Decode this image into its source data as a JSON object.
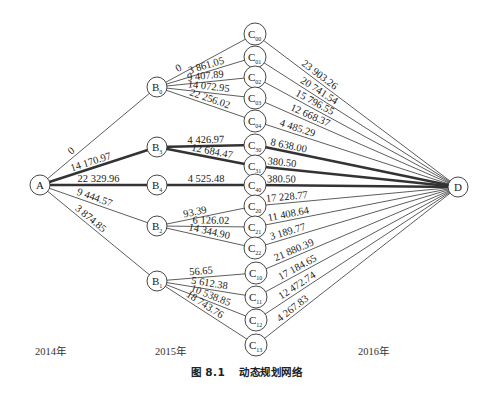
{
  "diagram": {
    "title": "动态规划网络",
    "figure_number": "图 8.1",
    "stage_labels": [
      {
        "text": "2014年",
        "x": 35
      },
      {
        "text": "2015年",
        "x": 155
      },
      {
        "text": "2016年",
        "x": 358
      }
    ],
    "nodes": [
      {
        "id": "A",
        "base": "A",
        "sub": "",
        "x": 40,
        "y": 185
      },
      {
        "id": "B0",
        "base": "B",
        "sub": "0",
        "x": 157,
        "y": 87
      },
      {
        "id": "B3",
        "base": "B",
        "sub": "3",
        "x": 157,
        "y": 147
      },
      {
        "id": "B4",
        "base": "B",
        "sub": "4",
        "x": 157,
        "y": 185
      },
      {
        "id": "B2",
        "base": "B",
        "sub": "2",
        "x": 157,
        "y": 226
      },
      {
        "id": "B1",
        "base": "B",
        "sub": "1",
        "x": 157,
        "y": 281
      },
      {
        "id": "C00",
        "base": "C",
        "sub": "00",
        "x": 255,
        "y": 34
      },
      {
        "id": "C01",
        "base": "C",
        "sub": "01",
        "x": 255,
        "y": 57
      },
      {
        "id": "C02",
        "base": "C",
        "sub": "02",
        "x": 255,
        "y": 77
      },
      {
        "id": "C03",
        "base": "C",
        "sub": "03",
        "x": 255,
        "y": 98
      },
      {
        "id": "C04",
        "base": "C",
        "sub": "04",
        "x": 255,
        "y": 121
      },
      {
        "id": "C30",
        "base": "C",
        "sub": "30",
        "x": 255,
        "y": 145
      },
      {
        "id": "C31",
        "base": "C",
        "sub": "31",
        "x": 255,
        "y": 166
      },
      {
        "id": "C40",
        "base": "C",
        "sub": "40",
        "x": 255,
        "y": 185
      },
      {
        "id": "C20",
        "base": "C",
        "sub": "20",
        "x": 255,
        "y": 206
      },
      {
        "id": "C21",
        "base": "C",
        "sub": "21",
        "x": 255,
        "y": 227
      },
      {
        "id": "C22",
        "base": "C",
        "sub": "22",
        "x": 255,
        "y": 248
      },
      {
        "id": "C10",
        "base": "C",
        "sub": "10",
        "x": 256,
        "y": 273
      },
      {
        "id": "C11",
        "base": "C",
        "sub": "11",
        "x": 256,
        "y": 297
      },
      {
        "id": "C12",
        "base": "C",
        "sub": "12",
        "x": 256,
        "y": 320
      },
      {
        "id": "C13",
        "base": "C",
        "sub": "13",
        "x": 256,
        "y": 345
      },
      {
        "id": "D",
        "base": "D",
        "sub": "",
        "x": 458,
        "y": 187
      }
    ],
    "edges": [
      {
        "from": "A",
        "to": "B0",
        "label": "0",
        "bold": false,
        "t": 0.3,
        "off": 3
      },
      {
        "from": "A",
        "to": "B3",
        "label": "14 170.97",
        "bold": true,
        "t": 0.45,
        "off": 3
      },
      {
        "from": "A",
        "to": "B4",
        "label": "22 329.96",
        "bold": true,
        "t": 0.5,
        "off": 3
      },
      {
        "from": "A",
        "to": "B2",
        "label": "9 444.57",
        "bold": false,
        "t": 0.45,
        "off": 3
      },
      {
        "from": "A",
        "to": "B1",
        "label": "3 874.85",
        "bold": false,
        "t": 0.4,
        "off": 3
      },
      {
        "from": "B0",
        "to": "C00",
        "label": "0",
        "bold": false,
        "t": 0.25,
        "off": 3
      },
      {
        "from": "B0",
        "to": "C01",
        "label": "3 861.05",
        "bold": false,
        "t": 0.52,
        "off": 3
      },
      {
        "from": "B0",
        "to": "C02",
        "label": "9 407.89",
        "bold": false,
        "t": 0.5,
        "off": 3
      },
      {
        "from": "B0",
        "to": "C03",
        "label": "14 072.95",
        "bold": false,
        "t": 0.52,
        "off": 3
      },
      {
        "from": "B0",
        "to": "C04",
        "label": "22 256.02",
        "bold": false,
        "t": 0.52,
        "off": 3
      },
      {
        "from": "B3",
        "to": "C30",
        "label": "4 426.97",
        "bold": true,
        "t": 0.5,
        "off": 3
      },
      {
        "from": "B3",
        "to": "C31",
        "label": "12 684.47",
        "bold": true,
        "t": 0.55,
        "off": 3
      },
      {
        "from": "B4",
        "to": "C40",
        "label": "4 525.48",
        "bold": true,
        "t": 0.5,
        "off": 3
      },
      {
        "from": "B2",
        "to": "C20",
        "label": "93.39",
        "bold": false,
        "t": 0.4,
        "off": 3
      },
      {
        "from": "B2",
        "to": "C21",
        "label": "6 126.02",
        "bold": false,
        "t": 0.55,
        "off": 3
      },
      {
        "from": "B2",
        "to": "C22",
        "label": "14 344.90",
        "bold": false,
        "t": 0.52,
        "off": 3
      },
      {
        "from": "B1",
        "to": "C10",
        "label": "56.65",
        "bold": false,
        "t": 0.45,
        "off": 3
      },
      {
        "from": "B1",
        "to": "C11",
        "label": "5 612.38",
        "bold": false,
        "t": 0.52,
        "off": 3
      },
      {
        "from": "B1",
        "to": "C12",
        "label": "10 538.85",
        "bold": false,
        "t": 0.52,
        "off": 3
      },
      {
        "from": "B1",
        "to": "C13",
        "label": "18 743.76",
        "bold": false,
        "t": 0.45,
        "off": 3
      },
      {
        "from": "C00",
        "to": "D",
        "label": "23 903.26",
        "bold": false,
        "t": 0.3,
        "off": 3
      },
      {
        "from": "C01",
        "to": "D",
        "label": "20 741.54",
        "bold": false,
        "t": 0.3,
        "off": 3
      },
      {
        "from": "C02",
        "to": "D",
        "label": "15 796.55",
        "bold": false,
        "t": 0.28,
        "off": 3
      },
      {
        "from": "C03",
        "to": "D",
        "label": "12 668.37",
        "bold": false,
        "t": 0.26,
        "off": 3
      },
      {
        "from": "C04",
        "to": "D",
        "label": "4 485.29",
        "bold": false,
        "t": 0.2,
        "off": 3
      },
      {
        "from": "C30",
        "to": "D",
        "label": "8 638.00",
        "bold": true,
        "t": 0.16,
        "off": 3
      },
      {
        "from": "C31",
        "to": "D",
        "label": "380.50",
        "bold": true,
        "t": 0.13,
        "off": 3
      },
      {
        "from": "C40",
        "to": "D",
        "label": "380.50",
        "bold": true,
        "t": 0.13,
        "off": 3
      },
      {
        "from": "C20",
        "to": "D",
        "label": "17 228.77",
        "bold": false,
        "t": 0.16,
        "off": 3
      },
      {
        "from": "C21",
        "to": "D",
        "label": "11 408.64",
        "bold": false,
        "t": 0.17,
        "off": 3
      },
      {
        "from": "C22",
        "to": "D",
        "label": "3 189.77",
        "bold": false,
        "t": 0.17,
        "off": 3
      },
      {
        "from": "C10",
        "to": "D",
        "label": "21 880.39",
        "bold": false,
        "t": 0.2,
        "off": 3
      },
      {
        "from": "C11",
        "to": "D",
        "label": "17 184.65",
        "bold": false,
        "t": 0.22,
        "off": 3
      },
      {
        "from": "C12",
        "to": "D",
        "label": "12 472.74",
        "bold": false,
        "t": 0.22,
        "off": 3
      },
      {
        "from": "C13",
        "to": "D",
        "label": "4 267.83",
        "bold": false,
        "t": 0.2,
        "off": 3
      }
    ],
    "style": {
      "line_color": "#333333",
      "text_color": "#222222",
      "background": "#ffffff",
      "normal_stroke": 0.8,
      "bold_stroke": 2.4,
      "node_radius_A_D": 10,
      "node_radius_B": 10,
      "node_radius_C": 11
    }
  }
}
